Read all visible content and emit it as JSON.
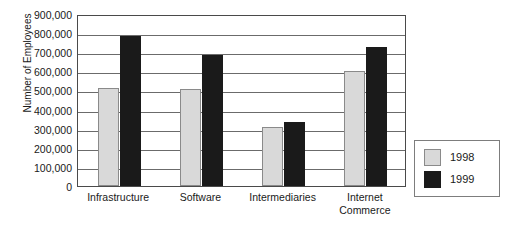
{
  "chart_data": {
    "type": "bar",
    "title": "",
    "xlabel": "",
    "ylabel": "Number of Employees",
    "categories": [
      "Infrastructure",
      "Software",
      "Intermediaries",
      "Internet\nCommerce"
    ],
    "series": [
      {
        "name": "1998",
        "color": "#d9d9d9",
        "values": [
          515000,
          510000,
          310000,
          600000
        ]
      },
      {
        "name": "1999",
        "color": "#1a1a1a",
        "values": [
          785000,
          685000,
          335000,
          725000
        ]
      }
    ],
    "ylim": [
      0,
      900000
    ],
    "ytick_step": 100000,
    "ytick_labels": [
      "900,000",
      "800,000",
      "700,000",
      "600,000",
      "500,000",
      "400,000",
      "300,000",
      "200,000",
      "100,000",
      "0"
    ],
    "grid": true,
    "legend_position": "right"
  },
  "legend": {
    "entries": [
      {
        "label": "1998"
      },
      {
        "label": "1999"
      }
    ]
  }
}
